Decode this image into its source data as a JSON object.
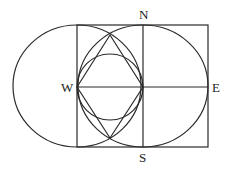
{
  "diagram": {
    "labels": {
      "north": "N",
      "south": "S",
      "west": "W",
      "east": "E"
    },
    "colors": {
      "stroke": "#2a2a2a",
      "background": "#ffffff"
    }
  }
}
